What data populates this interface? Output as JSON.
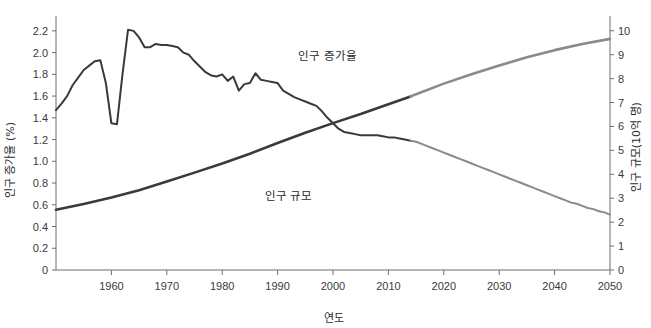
{
  "chart_data": {
    "type": "line",
    "title": "",
    "xlabel": "연도",
    "ylabel": "인구 증가율 (%)",
    "y2label": "인구 규모(10억 명)",
    "xlim": [
      1950,
      2050
    ],
    "ylim": [
      0,
      2.3
    ],
    "y2lim": [
      0,
      10.45
    ],
    "grid": false,
    "legend_position": "inline-annotations",
    "x_ticks": [
      "1960",
      "1970",
      "1980",
      "1990",
      "2000",
      "2010",
      "2020",
      "2030",
      "2040",
      "2050"
    ],
    "x_tick_values": [
      1960,
      1970,
      1980,
      1990,
      2000,
      2010,
      2020,
      2030,
      2040,
      2050
    ],
    "y_ticks": [
      "0",
      "0.2",
      "0.4",
      "0.6",
      "0.8",
      "1.0",
      "1.2",
      "1.4",
      "1.6",
      "1.8",
      "2.0",
      "2.2"
    ],
    "y_tick_values": [
      0,
      0.2,
      0.4,
      0.6,
      0.8,
      1.0,
      1.2,
      1.4,
      1.6,
      1.8,
      2.0,
      2.2
    ],
    "y2_ticks": [
      "0",
      "1",
      "2",
      "3",
      "4",
      "5",
      "6",
      "7",
      "8",
      "9",
      "10"
    ],
    "y2_tick_values": [
      0,
      1,
      2,
      3,
      4,
      5,
      6,
      7,
      8,
      9,
      10
    ],
    "annotations": [
      {
        "text": "인구 증가율",
        "x": 1999,
        "y": 1.93
      },
      {
        "text": "인구 규모",
        "x": 1992,
        "y": 0.64
      }
    ],
    "colors": {
      "historical": "#3a3a3a",
      "projection": "#8a8a8a",
      "axis": "#6e6e6e"
    },
    "projection_start_year": 2014,
    "series": [
      {
        "name": "인구 증가율",
        "axis": "left",
        "unit": "%",
        "x": [
          1950,
          1951,
          1952,
          1953,
          1954,
          1955,
          1956,
          1957,
          1958,
          1959,
          1960,
          1961,
          1962,
          1963,
          1964,
          1965,
          1966,
          1967,
          1968,
          1969,
          1970,
          1971,
          1972,
          1973,
          1974,
          1975,
          1976,
          1977,
          1978,
          1979,
          1980,
          1981,
          1982,
          1983,
          1984,
          1985,
          1986,
          1987,
          1988,
          1989,
          1990,
          1991,
          1992,
          1993,
          1994,
          1995,
          1996,
          1997,
          1998,
          1999,
          2000,
          2001,
          2002,
          2003,
          2004,
          2005,
          2006,
          2007,
          2008,
          2009,
          2010,
          2011,
          2012,
          2013,
          2014,
          2015,
          2016,
          2017,
          2018,
          2019,
          2020,
          2021,
          2022,
          2023,
          2024,
          2025,
          2026,
          2027,
          2028,
          2029,
          2030,
          2031,
          2032,
          2033,
          2034,
          2035,
          2036,
          2037,
          2038,
          2039,
          2040,
          2041,
          2042,
          2043,
          2044,
          2045,
          2046,
          2047,
          2048,
          2049,
          2050
        ],
        "values": [
          1.47,
          1.53,
          1.6,
          1.7,
          1.77,
          1.84,
          1.88,
          1.92,
          1.93,
          1.72,
          1.35,
          1.34,
          1.8,
          2.21,
          2.2,
          2.14,
          2.05,
          2.05,
          2.08,
          2.07,
          2.07,
          2.06,
          2.05,
          2.0,
          1.98,
          1.92,
          1.87,
          1.82,
          1.79,
          1.78,
          1.8,
          1.74,
          1.78,
          1.65,
          1.71,
          1.72,
          1.81,
          1.75,
          1.74,
          1.73,
          1.72,
          1.65,
          1.62,
          1.59,
          1.57,
          1.55,
          1.53,
          1.51,
          1.46,
          1.4,
          1.35,
          1.3,
          1.27,
          1.26,
          1.25,
          1.24,
          1.24,
          1.24,
          1.24,
          1.23,
          1.22,
          1.22,
          1.21,
          1.2,
          1.19,
          1.18,
          1.16,
          1.14,
          1.12,
          1.1,
          1.08,
          1.06,
          1.04,
          1.02,
          1.0,
          0.98,
          0.96,
          0.94,
          0.92,
          0.9,
          0.88,
          0.86,
          0.84,
          0.82,
          0.8,
          0.78,
          0.76,
          0.74,
          0.72,
          0.7,
          0.68,
          0.66,
          0.64,
          0.62,
          0.61,
          0.59,
          0.57,
          0.56,
          0.54,
          0.53,
          0.51
        ]
      },
      {
        "name": "인구 규모",
        "axis": "right",
        "unit": "10억 명",
        "x": [
          1950,
          1955,
          1960,
          1965,
          1970,
          1975,
          1980,
          1985,
          1990,
          1995,
          2000,
          2005,
          2010,
          2014,
          2015,
          2020,
          2025,
          2030,
          2035,
          2040,
          2045,
          2050
        ],
        "values": [
          2.52,
          2.76,
          3.03,
          3.33,
          3.7,
          4.07,
          4.45,
          4.86,
          5.31,
          5.74,
          6.14,
          6.52,
          6.93,
          7.25,
          7.35,
          7.79,
          8.18,
          8.55,
          8.89,
          9.19,
          9.45,
          9.66
        ]
      }
    ]
  }
}
